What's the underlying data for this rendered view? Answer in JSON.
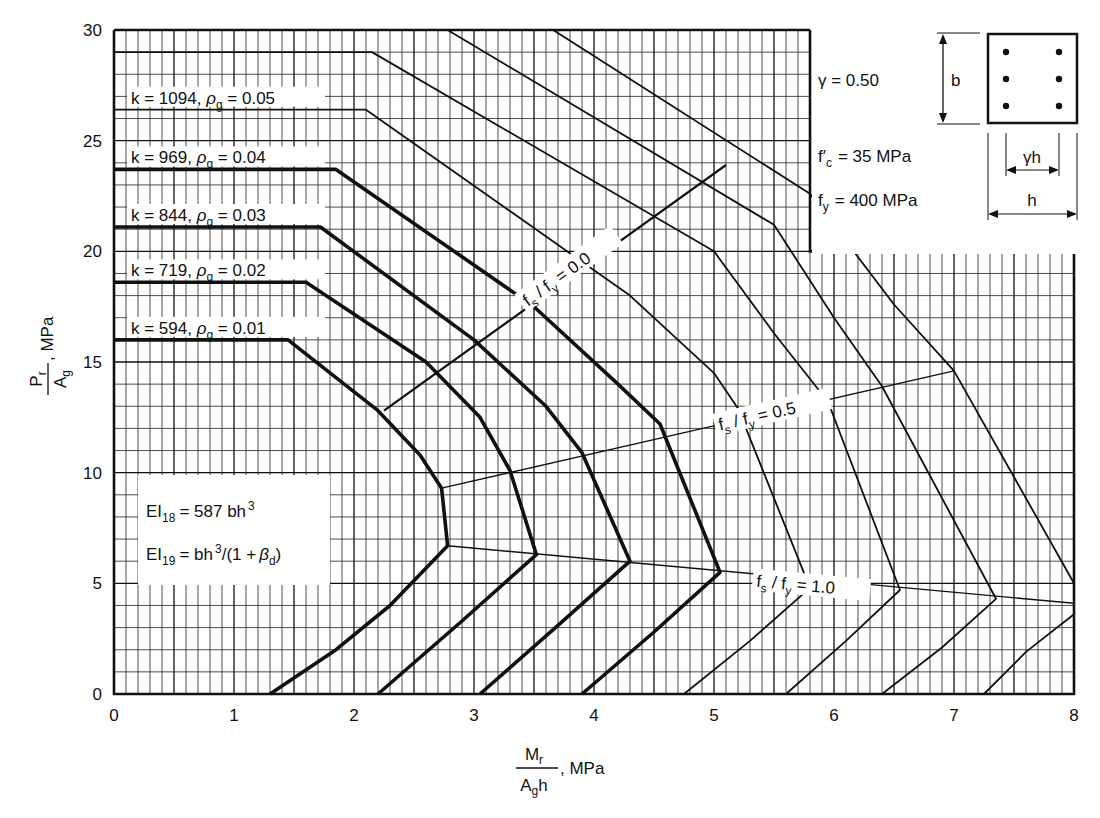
{
  "chart_data": {
    "type": "line",
    "title": "",
    "xlabel": {
      "numerator": "M",
      "numerator_sub": "r",
      "denominator": "A",
      "denominator_sub": "g",
      "denominator_tail": "h",
      "unit": ", MPa"
    },
    "ylabel": {
      "numerator": "P",
      "numerator_sub": "r",
      "denominator": "A",
      "denominator_sub": "g",
      "unit": ", MPa"
    },
    "xlim": [
      0,
      8
    ],
    "ylim": [
      0,
      30
    ],
    "x_ticks": [
      "0",
      "1",
      "2",
      "3",
      "4",
      "5",
      "6",
      "7",
      "8"
    ],
    "y_ticks": [
      "0",
      "5",
      "10",
      "15",
      "20",
      "25",
      "30"
    ],
    "x_minor_step": 0.1,
    "y_minor_step": 1,
    "grid": true,
    "series": [
      {
        "name": "rho_g = 0.01",
        "k": "594",
        "rho": "0.01",
        "weight": "thick",
        "points": [
          [
            0,
            16
          ],
          [
            1.45,
            16
          ],
          [
            2.2,
            12.8
          ],
          [
            2.55,
            10.8
          ],
          [
            2.73,
            9.3
          ],
          [
            2.78,
            6.7
          ],
          [
            2.3,
            4.0
          ],
          [
            1.85,
            2.0
          ],
          [
            1.3,
            0
          ]
        ]
      },
      {
        "name": "rho_g = 0.02",
        "k": "719",
        "rho": "0.02",
        "weight": "thick",
        "points": [
          [
            0,
            18.6
          ],
          [
            1.6,
            18.6
          ],
          [
            2.6,
            15.0
          ],
          [
            3.05,
            12.5
          ],
          [
            3.3,
            10.1
          ],
          [
            3.52,
            6.3
          ],
          [
            2.9,
            3.3
          ],
          [
            2.2,
            0
          ]
        ]
      },
      {
        "name": "rho_g = 0.03",
        "k": "844",
        "rho": "0.03",
        "weight": "thick",
        "points": [
          [
            0,
            21.1
          ],
          [
            1.72,
            21.1
          ],
          [
            3.0,
            16.0
          ],
          [
            3.6,
            13.0
          ],
          [
            3.9,
            10.9
          ],
          [
            4.3,
            6.0
          ],
          [
            3.7,
            3.1
          ],
          [
            3.05,
            0
          ]
        ]
      },
      {
        "name": "rho_g = 0.04",
        "k": "969",
        "rho": "0.04",
        "weight": "thick",
        "points": [
          [
            0,
            23.7
          ],
          [
            1.85,
            23.7
          ],
          [
            3.5,
            17.5
          ],
          [
            4.2,
            14.0
          ],
          [
            4.55,
            12.2
          ],
          [
            5.05,
            5.5
          ],
          [
            4.5,
            2.8
          ],
          [
            3.9,
            0
          ]
        ]
      },
      {
        "name": "rho_g = 0.05",
        "k": "1094",
        "rho": "0.05",
        "weight": "thin",
        "points": [
          [
            0,
            26.4
          ],
          [
            2.1,
            26.4
          ],
          [
            4.3,
            18.0
          ],
          [
            5.0,
            14.5
          ],
          [
            5.2,
            12.9
          ],
          [
            5.8,
            4.8
          ],
          [
            5.3,
            2.4
          ],
          [
            4.75,
            0
          ]
        ]
      },
      {
        "name": "rho_g = 0.06",
        "k": "",
        "rho": "0.06",
        "weight": "thin",
        "points": [
          [
            0,
            29.0
          ],
          [
            2.15,
            29.0
          ],
          [
            5.0,
            20.0
          ],
          [
            5.5,
            16.3
          ],
          [
            5.95,
            13.2
          ],
          [
            6.55,
            4.7
          ],
          [
            6.1,
            2.4
          ],
          [
            5.6,
            0
          ]
        ]
      },
      {
        "name": "rho_g = 0.07",
        "k": "",
        "rho": "0.07",
        "weight": "thin",
        "points": [
          [
            2.78,
            30
          ],
          [
            5.5,
            21.2
          ],
          [
            6.0,
            17.0
          ],
          [
            6.4,
            13.9
          ],
          [
            7.35,
            4.3
          ],
          [
            6.9,
            2.1
          ],
          [
            6.4,
            0
          ]
        ]
      },
      {
        "name": "rho_g = 0.08",
        "k": "",
        "rho": "0.08",
        "weight": "thin",
        "points": [
          [
            3.66,
            30
          ],
          [
            5.8,
            22.6
          ],
          [
            6.5,
            17.6
          ],
          [
            7.0,
            14.6
          ],
          [
            8.0,
            5.0
          ]
        ]
      },
      {
        "name": "rho_g = 0.08 lower",
        "k": "",
        "rho": "0.08",
        "weight": "thin",
        "points": [
          [
            8.0,
            3.6
          ],
          [
            7.6,
            1.9
          ],
          [
            7.25,
            0
          ]
        ]
      }
    ],
    "strain_lines": [
      {
        "label_a": "f",
        "label_a_sub": "s",
        "label_b": "f",
        "label_b_sub": "y",
        "value": "0.0",
        "points": [
          [
            2.25,
            12.8
          ],
          [
            5.1,
            23.9
          ]
        ]
      },
      {
        "label_a": "f",
        "label_a_sub": "s",
        "label_b": "f",
        "label_b_sub": "y",
        "value": "0.5",
        "points": [
          [
            2.73,
            9.3
          ],
          [
            7.0,
            14.6
          ]
        ]
      },
      {
        "label_a": "f",
        "label_a_sub": "s",
        "label_b": "f",
        "label_b_sub": "y",
        "value": "1.0",
        "points": [
          [
            2.78,
            6.7
          ],
          [
            8.0,
            4.1
          ]
        ]
      }
    ],
    "curve_labels": [
      {
        "k": "1094",
        "rho": "0.05"
      },
      {
        "k": "969",
        "rho": "0.04"
      },
      {
        "k": "844",
        "rho": "0.03"
      },
      {
        "k": "719",
        "rho": "0.02"
      },
      {
        "k": "594",
        "rho": "0.01"
      }
    ],
    "annotations": {
      "ei18": {
        "prefix": "EI",
        "sub": "18",
        "rhs": "= 587 bh",
        "sup": "3"
      },
      "ei19": {
        "prefix": "EI",
        "sub": "19",
        "rhs": "= bh",
        "sup": "3",
        "tail": "/(1 +",
        "beta": "β",
        "beta_sub": "d",
        "close": ")"
      },
      "gamma": "γ  = 0.50",
      "fc": {
        "main": "f′",
        "sub": "c",
        "rhs": "=  35  MPa"
      },
      "fy": {
        "main": "f",
        "sub": "y",
        "rhs": "= 400  MPa"
      },
      "section": {
        "b_label": "b",
        "gh_label": "γh",
        "h_label": "h",
        "bars": 6
      }
    },
    "legend": "none"
  }
}
